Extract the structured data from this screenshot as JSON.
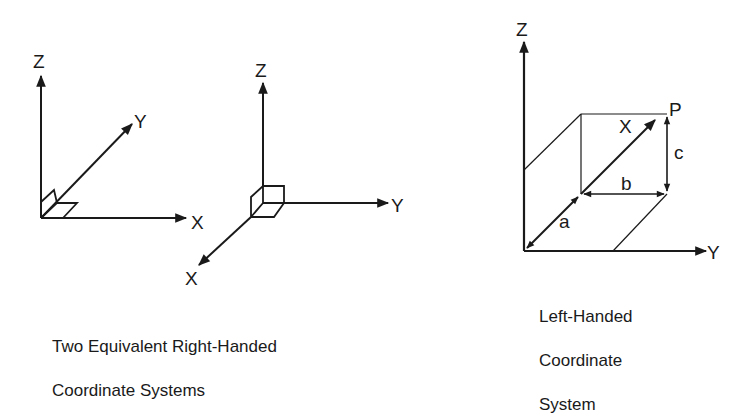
{
  "diagram1": {
    "labels": {
      "z": "Z",
      "y": "Y",
      "x": "X"
    }
  },
  "diagram2": {
    "labels": {
      "z": "Z",
      "y": "Y",
      "x": "X"
    }
  },
  "diagram3": {
    "labels": {
      "z": "Z",
      "y": "Y",
      "x": "X",
      "p": "P",
      "a": "a",
      "b": "b",
      "c": "c"
    }
  },
  "captions": {
    "right_handed_line1": "Two Equivalent Right-Handed",
    "right_handed_line2": "Coordinate Systems",
    "left_handed_line1": "Left-Handed",
    "left_handed_line2": "Coordinate",
    "left_handed_line3": "System"
  },
  "colors": {
    "stroke": "#1a1a1a",
    "background": "#ffffff"
  }
}
